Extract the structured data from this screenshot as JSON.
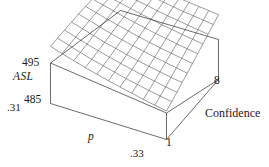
{
  "figure": {
    "kind": "3d-wireframe-surface-plot",
    "background_color": "#ffffff",
    "line_color": "#3a3a3a",
    "box_color": "#2b2b2b"
  },
  "labels": {
    "z_axis_name": "ASL",
    "z_max": "495",
    "z_min": "485",
    "x_axis_name": "p",
    "x_min": ".31",
    "x_max": ".33",
    "y_axis_name": "Confidence",
    "y_min": "1",
    "y_max": "8"
  },
  "chart_data": {
    "type": "surface",
    "title": "",
    "xlabel": "p",
    "ylabel": "Confidence",
    "zlabel": "ASL",
    "xlim": [
      0.31,
      0.33
    ],
    "ylim": [
      1,
      8
    ],
    "zlim": [
      485,
      495
    ],
    "grid": true,
    "legend": "none",
    "x_ticks": [
      ".31",
      ".33"
    ],
    "y_ticks": [
      "1",
      "8"
    ],
    "z_ticks": [
      "485",
      "495"
    ],
    "mesh_nx": 11,
    "mesh_ny": 11,
    "x": [
      0.31,
      0.312,
      0.314,
      0.316,
      0.318,
      0.32,
      0.322,
      0.324,
      0.326,
      0.328,
      0.33
    ],
    "y": [
      1.0,
      1.7,
      2.4,
      3.1,
      3.8,
      4.5,
      5.2,
      5.9,
      6.6,
      7.3,
      8.0
    ],
    "z": [
      [
        489.2,
        489.9,
        490.6,
        491.3,
        492.0,
        492.6,
        493.1,
        493.6,
        494.1,
        494.6,
        495.0
      ],
      [
        488.6,
        489.3,
        490.0,
        490.7,
        491.4,
        492.0,
        492.6,
        493.1,
        493.6,
        494.1,
        494.6
      ],
      [
        488.1,
        488.7,
        489.4,
        490.1,
        490.8,
        491.4,
        492.0,
        492.6,
        493.1,
        493.6,
        494.1
      ],
      [
        487.6,
        488.2,
        488.9,
        489.5,
        490.2,
        490.9,
        491.5,
        492.1,
        492.6,
        493.1,
        493.6
      ],
      [
        487.2,
        487.8,
        488.4,
        489.1,
        489.7,
        490.4,
        491.0,
        491.6,
        492.2,
        492.7,
        493.2
      ],
      [
        486.8,
        487.4,
        488.0,
        488.6,
        489.3,
        489.9,
        490.6,
        491.2,
        491.7,
        492.3,
        492.8
      ],
      [
        486.5,
        487.0,
        487.6,
        488.2,
        488.9,
        489.5,
        490.1,
        490.7,
        491.3,
        491.9,
        492.4
      ],
      [
        486.2,
        486.7,
        487.3,
        487.9,
        488.5,
        489.1,
        489.8,
        490.4,
        491.0,
        491.5,
        492.1
      ],
      [
        485.9,
        486.4,
        487.0,
        487.6,
        488.2,
        488.8,
        489.4,
        490.0,
        490.6,
        491.2,
        491.8
      ],
      [
        485.7,
        486.2,
        486.7,
        487.3,
        487.9,
        488.5,
        489.1,
        489.7,
        490.3,
        490.9,
        491.5
      ],
      [
        485.5,
        486.0,
        486.5,
        487.1,
        487.6,
        488.2,
        488.8,
        489.4,
        490.0,
        490.6,
        491.2
      ]
    ]
  }
}
